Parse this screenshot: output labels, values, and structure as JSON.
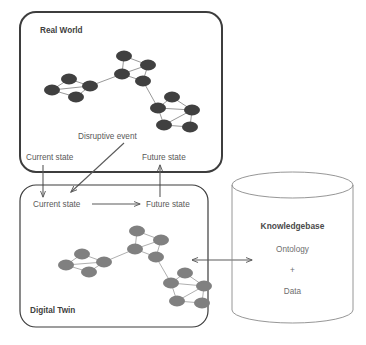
{
  "figure": {
    "background_color": "#ffffff"
  },
  "real_world": {
    "label": "Real World",
    "box": {
      "x": 20,
      "y": 12,
      "w": 202,
      "h": 160,
      "radius": 16,
      "stroke": "#3d3d3d",
      "stroke_width": 2
    },
    "node_color": "#404040",
    "edge_color": "#6b6b6b",
    "current_state_label": "Current state",
    "future_state_label": "Future state",
    "disruptive_event_label": "Disruptive event"
  },
  "digital_twin": {
    "label": "Digital Twin",
    "box": {
      "x": 20,
      "y": 185,
      "w": 188,
      "h": 142,
      "radius": 16,
      "stroke": "#4a4a4a",
      "stroke_width": 1.2
    },
    "node_color": "#808080",
    "edge_color": "#8c8c8c",
    "current_state_label": "Current state",
    "future_state_label": "Future state"
  },
  "knowledgebase": {
    "title": "Knowledgebase",
    "lines": [
      "Ontology",
      "+",
      "Data"
    ],
    "cylinder": {
      "x": 232,
      "y": 185,
      "w": 121,
      "h": 138,
      "ellipse_ry": 13,
      "stroke": "#8a8a8a"
    }
  },
  "connectors": {
    "current_state_down": {
      "name": "current-state-down-arrow",
      "x": 43,
      "y1": 160,
      "y2": 196
    },
    "future_state_up": {
      "name": "future-state-up-arrow",
      "x": 160,
      "y1": 196,
      "y2": 160
    },
    "disruptive_event": {
      "name": "disruptive-event-arrow",
      "x1": 124,
      "y1": 143,
      "x2": 70,
      "y2": 192
    },
    "dt_state_transition": {
      "name": "digital-twin-state-arrow",
      "x1": 92,
      "y1": 204,
      "x2": 142,
      "y2": 204
    },
    "kb_link": {
      "name": "knowledgebase-bidirectional-arrow",
      "x1": 190,
      "y1": 260,
      "x2": 253,
      "y2": 260,
      "double_headed": true
    }
  },
  "network_top": {
    "nodes": [
      {
        "id": "n0",
        "cx": 52,
        "cy": 90,
        "rx": 8.0,
        "ry": 5.4
      },
      {
        "id": "n1",
        "cx": 69,
        "cy": 79,
        "rx": 8.0,
        "ry": 5.4
      },
      {
        "id": "n2",
        "cx": 76,
        "cy": 97,
        "rx": 8.0,
        "ry": 5.4
      },
      {
        "id": "n3",
        "cx": 90,
        "cy": 86,
        "rx": 8.0,
        "ry": 5.4
      },
      {
        "id": "n4",
        "cx": 122,
        "cy": 74,
        "rx": 8.0,
        "ry": 5.4
      },
      {
        "id": "n5",
        "cx": 124,
        "cy": 56,
        "rx": 8.0,
        "ry": 5.4
      },
      {
        "id": "n6",
        "cx": 148,
        "cy": 65,
        "rx": 8.0,
        "ry": 5.4
      },
      {
        "id": "n7",
        "cx": 143,
        "cy": 81,
        "rx": 8.0,
        "ry": 5.4
      },
      {
        "id": "n8",
        "cx": 172,
        "cy": 97,
        "rx": 8.0,
        "ry": 5.4
      },
      {
        "id": "n9",
        "cx": 158,
        "cy": 108,
        "rx": 8.0,
        "ry": 5.4
      },
      {
        "id": "n10",
        "cx": 192,
        "cy": 110,
        "rx": 8.0,
        "ry": 5.4
      },
      {
        "id": "n11",
        "cx": 164,
        "cy": 125,
        "rx": 8.0,
        "ry": 5.4
      },
      {
        "id": "n12",
        "cx": 190,
        "cy": 127,
        "rx": 8.0,
        "ry": 5.4
      }
    ],
    "edges": [
      [
        "n0",
        "n1"
      ],
      [
        "n0",
        "n2"
      ],
      [
        "n0",
        "n3"
      ],
      [
        "n1",
        "n3"
      ],
      [
        "n2",
        "n3"
      ],
      [
        "n3",
        "n4"
      ],
      [
        "n4",
        "n5"
      ],
      [
        "n4",
        "n6"
      ],
      [
        "n4",
        "n7"
      ],
      [
        "n5",
        "n6"
      ],
      [
        "n6",
        "n7"
      ],
      [
        "n7",
        "n9"
      ],
      [
        "n9",
        "n8"
      ],
      [
        "n9",
        "n10"
      ],
      [
        "n9",
        "n11"
      ],
      [
        "n8",
        "n10"
      ],
      [
        "n10",
        "n12"
      ],
      [
        "n11",
        "n12"
      ],
      [
        "n11",
        "n10"
      ]
    ]
  },
  "network_bottom": {
    "nodes": [
      {
        "id": "m0",
        "cx": 66,
        "cy": 265,
        "rx": 8.0,
        "ry": 5.4
      },
      {
        "id": "m1",
        "cx": 82,
        "cy": 254,
        "rx": 8.0,
        "ry": 5.4
      },
      {
        "id": "m2",
        "cx": 89,
        "cy": 272,
        "rx": 8.0,
        "ry": 5.4
      },
      {
        "id": "m3",
        "cx": 104,
        "cy": 262,
        "rx": 8.0,
        "ry": 5.4
      },
      {
        "id": "m4",
        "cx": 135,
        "cy": 249,
        "rx": 8.0,
        "ry": 5.4
      },
      {
        "id": "m5",
        "cx": 137,
        "cy": 231,
        "rx": 8.0,
        "ry": 5.4
      },
      {
        "id": "m6",
        "cx": 161,
        "cy": 240,
        "rx": 8.0,
        "ry": 5.4
      },
      {
        "id": "m7",
        "cx": 156,
        "cy": 257,
        "rx": 8.0,
        "ry": 5.4
      },
      {
        "id": "m8",
        "cx": 185,
        "cy": 273,
        "rx": 8.0,
        "ry": 5.4
      },
      {
        "id": "m9",
        "cx": 171,
        "cy": 283,
        "rx": 8.0,
        "ry": 5.4
      },
      {
        "id": "m10",
        "cx": 204,
        "cy": 286,
        "rx": 8.0,
        "ry": 5.4
      },
      {
        "id": "m11",
        "cx": 177,
        "cy": 301,
        "rx": 8.0,
        "ry": 5.4
      },
      {
        "id": "m12",
        "cx": 202,
        "cy": 303,
        "rx": 8.0,
        "ry": 5.4
      }
    ],
    "edges": [
      [
        "m0",
        "m1"
      ],
      [
        "m0",
        "m2"
      ],
      [
        "m0",
        "m3"
      ],
      [
        "m1",
        "m3"
      ],
      [
        "m2",
        "m3"
      ],
      [
        "m3",
        "m4"
      ],
      [
        "m4",
        "m5"
      ],
      [
        "m4",
        "m6"
      ],
      [
        "m4",
        "m7"
      ],
      [
        "m5",
        "m6"
      ],
      [
        "m6",
        "m7"
      ],
      [
        "m7",
        "m9"
      ],
      [
        "m9",
        "m8"
      ],
      [
        "m9",
        "m10"
      ],
      [
        "m9",
        "m11"
      ],
      [
        "m8",
        "m10"
      ],
      [
        "m10",
        "m12"
      ],
      [
        "m11",
        "m12"
      ],
      [
        "m11",
        "m10"
      ]
    ]
  }
}
